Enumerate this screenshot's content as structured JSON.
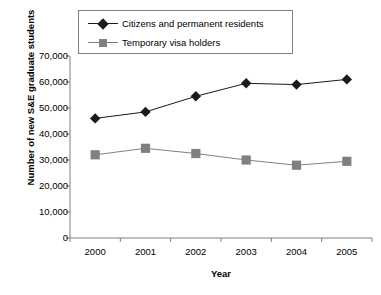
{
  "chart_data": {
    "type": "line",
    "title": "",
    "xlabel": "Year",
    "ylabel": "Number of new S&E graduate students",
    "categories": [
      "2000",
      "2001",
      "2002",
      "2003",
      "2004",
      "2005"
    ],
    "x": [
      2000,
      2001,
      2002,
      2003,
      2004,
      2005
    ],
    "ylim": [
      0,
      70000
    ],
    "ytick_labels": [
      "70,000",
      "60,000",
      "50,000",
      "40,000",
      "30,000",
      "20,000",
      "10,000",
      "0"
    ],
    "ytick_values": [
      70000,
      60000,
      50000,
      40000,
      30000,
      20000,
      10000,
      0
    ],
    "grid": false,
    "legend_position": "top-center",
    "series": [
      {
        "name": "Citizens and permanent residents",
        "marker": "diamond",
        "color": "#1a1a1a",
        "values": [
          46000,
          48500,
          54500,
          59500,
          59000,
          61000
        ]
      },
      {
        "name": "Temporary visa holders",
        "marker": "square",
        "color": "#808080",
        "values": [
          32000,
          34500,
          32500,
          30000,
          28000,
          29500
        ]
      }
    ]
  },
  "legend": {
    "items": [
      {
        "label": "Citizens and permanent residents",
        "marker": "diamond-marker"
      },
      {
        "label": "Temporary visa holders",
        "marker": "square-marker"
      }
    ]
  },
  "axes": {
    "y_title": "Number of new S&E graduate students",
    "x_title": "Year"
  },
  "colors": {
    "series_1": "#1a1a1a",
    "series_2": "#808080",
    "axis": "#808080",
    "background": "#ffffff"
  }
}
